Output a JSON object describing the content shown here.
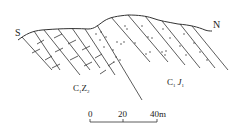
{
  "diagram": {
    "type": "geological-cross-section",
    "orientation": {
      "left_label": "S",
      "right_label": "N"
    },
    "formations": [
      {
        "id": "c1z2",
        "label_main1": "C",
        "label_sub1": "1",
        "label_main2": "Z",
        "label_sub2": "2",
        "pattern": "limestone-brick"
      },
      {
        "id": "c1j1",
        "label_main1": "C",
        "label_sub1": "1",
        "label_main2": "J",
        "label_sub2": "1",
        "pattern": "sandstone-dots"
      }
    ],
    "scale_bar": {
      "ticks": [
        "0",
        "20",
        "40m"
      ],
      "unit": "m",
      "max": 40
    },
    "colors": {
      "line": "#333333",
      "text": "#222222",
      "background": "#ffffff"
    }
  }
}
